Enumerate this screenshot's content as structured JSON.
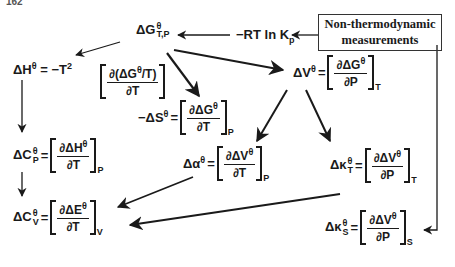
{
  "page_number": "162",
  "box": {
    "line1": "Non-thermodynamic",
    "line2": "measurements"
  },
  "nodes": {
    "dG": {
      "label": "ΔG",
      "sup": "θ",
      "sub": "T,P"
    },
    "rtlnk": {
      "label": "−RT ln  K",
      "sub": "p"
    },
    "dH": {
      "label": "ΔH",
      "sup": "θ",
      "rhs": "= −T",
      "rhs_sup": "2",
      "num": "∂(ΔG",
      "num_sup": "θ",
      "num_tail": "/T)",
      "den": "∂T"
    },
    "dS": {
      "label": "−ΔS",
      "sup": "θ",
      "num": "∂ΔG",
      "num_sup": "θ",
      "den": "∂T",
      "subscript": "P"
    },
    "dV": {
      "label": "ΔV",
      "sup": "θ",
      "num": "∂ΔG",
      "num_sup": "θ",
      "den": "∂P",
      "subscript": "T"
    },
    "dCp": {
      "label": "ΔC",
      "sup": "θ",
      "sub": "P",
      "num": "∂ΔH",
      "num_sup": "θ",
      "den": "∂T",
      "subscript": "P"
    },
    "dalpha": {
      "label": "Δα",
      "sup": "θ",
      "num": "∂ΔV",
      "num_sup": "θ",
      "den": "∂T",
      "subscript": "P"
    },
    "dkT": {
      "label": "Δκ",
      "sup": "θ",
      "sub": "T",
      "num": "∂ΔV",
      "num_sup": "θ",
      "den": "∂P",
      "subscript": "T"
    },
    "dCv": {
      "label": "ΔC",
      "sup": "θ",
      "sub": "V",
      "num": "∂ΔE",
      "num_sup": "θ",
      "den": "∂T",
      "subscript": "V"
    },
    "dkS": {
      "label": "Δκ",
      "sup": "θ",
      "sub": "S",
      "num": "∂ΔV",
      "num_sup": "θ",
      "den": "∂P",
      "subscript": "S"
    }
  },
  "edges": [
    {
      "from": "measurements",
      "to": "−RT ln Kp"
    },
    {
      "from": "−RT ln Kp",
      "to": "ΔG°T,P"
    },
    {
      "from": "ΔG°T,P",
      "to": "ΔH°"
    },
    {
      "from": "ΔG°T,P",
      "to": "−ΔS°"
    },
    {
      "from": "ΔG°T,P",
      "to": "ΔV°"
    },
    {
      "from": "ΔH°",
      "to": "ΔC°P"
    },
    {
      "from": "ΔC°P",
      "to": "ΔC°V"
    },
    {
      "from": "ΔV°",
      "to": "Δα°"
    },
    {
      "from": "ΔV°",
      "to": "Δκ°T"
    },
    {
      "from": "Δα°",
      "to": "ΔC°V"
    },
    {
      "from": "Δκ°T",
      "to": "ΔC°V"
    },
    {
      "from": "measurements",
      "to": "Δκ°S"
    }
  ]
}
